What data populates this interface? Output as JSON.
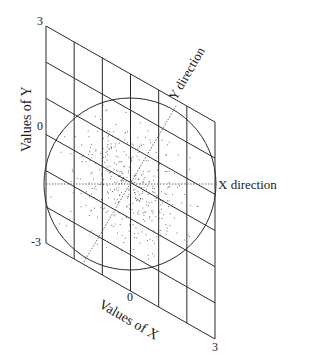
{
  "diagram": {
    "type": "skewed-coordinate-grid",
    "y_axis": {
      "title": "Values of Y",
      "ticks": [
        "3",
        "0",
        "-3"
      ]
    },
    "x_axis": {
      "title": "Values of X",
      "ticks": [
        "0",
        "3"
      ]
    },
    "direction_labels": {
      "x": "X direction",
      "y": "Y direction"
    },
    "grid": {
      "columns": 6,
      "rows": 6
    },
    "colors": {
      "line": "#2a2a2a",
      "dots": "#555555",
      "background": "#ffffff"
    }
  }
}
